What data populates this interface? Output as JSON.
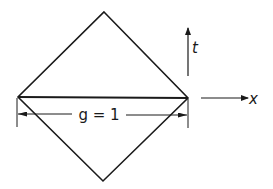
{
  "diagram": {
    "stroke_color": "#1a1a1a",
    "background": "#ffffff",
    "axes": {
      "t_label": "t",
      "x_label": "x"
    },
    "dimension": {
      "label": "g = 1"
    },
    "shapes": {
      "diamond": {
        "top": [
          104,
          12
        ],
        "right": [
          188,
          98
        ],
        "bottom": [
          103,
          181
        ],
        "left": [
          18,
          97
        ]
      },
      "diagonal": {
        "from": [
          18,
          97
        ],
        "to": [
          188,
          98
        ]
      }
    }
  }
}
